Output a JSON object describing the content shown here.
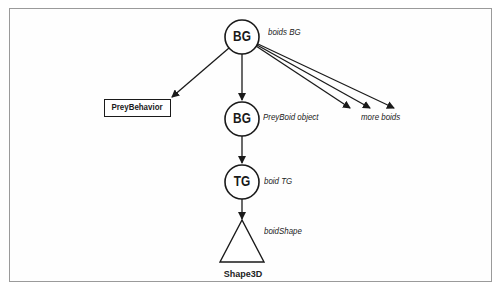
{
  "diagram": {
    "nodes": {
      "root_bg": {
        "label": "BG",
        "caption": "boids BG",
        "shape": "circle"
      },
      "prey_behavior": {
        "label": "PreyBehavior",
        "shape": "rectangle"
      },
      "boid_bg": {
        "label": "BG",
        "caption": "PreyBoid object",
        "shape": "circle"
      },
      "boid_tg": {
        "label": "TG",
        "caption": "boid TG",
        "shape": "circle"
      },
      "boid_shape": {
        "label": "Shape3D",
        "caption": "boidShape",
        "shape": "triangle"
      }
    },
    "more_boids_caption": "more boids",
    "edges": [
      {
        "from": "root_bg",
        "to": "prey_behavior"
      },
      {
        "from": "root_bg",
        "to": "boid_bg"
      },
      {
        "from": "root_bg",
        "to": "more_boids_1"
      },
      {
        "from": "root_bg",
        "to": "more_boids_2"
      },
      {
        "from": "root_bg",
        "to": "more_boids_3"
      },
      {
        "from": "boid_bg",
        "to": "boid_tg"
      },
      {
        "from": "boid_tg",
        "to": "boid_shape"
      }
    ],
    "colors": {
      "stroke": "#1a1a1a",
      "frame": "#9a9a9a",
      "background": "#ffffff"
    }
  }
}
